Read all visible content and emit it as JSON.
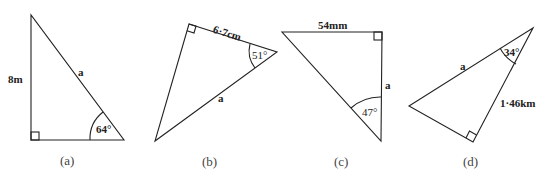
{
  "figures": [
    {
      "caption": "(a)",
      "side_label": "8m",
      "hypotenuse_label": "a",
      "angle_label": "64°",
      "right_angle": "bottom-left"
    },
    {
      "caption": "(b)",
      "side_label": "6·7cm",
      "hypotenuse_label": "a",
      "angle_label": "51°",
      "right_angle": "top-left"
    },
    {
      "caption": "(c)",
      "side_label": "54mm",
      "unknown_label": "a",
      "angle_label": "47°",
      "right_angle": "top-right"
    },
    {
      "caption": "(d)",
      "side_label": "1·46km",
      "hypotenuse_label": "a",
      "angle_label": "34°",
      "right_angle": "bottom"
    }
  ],
  "colors": {
    "stroke": "#222222",
    "background": "#ffffff"
  }
}
